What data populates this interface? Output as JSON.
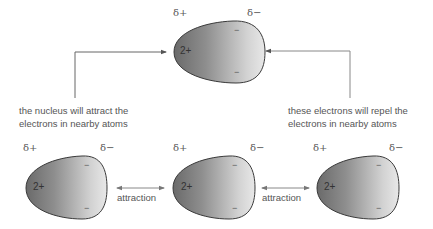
{
  "top_atom": {
    "delta_plus": "δ+",
    "delta_minus": "δ−",
    "nucleus_charge": "2+",
    "electron_sign": "−"
  },
  "captions": {
    "left_line1": "the nucleus will attract the",
    "left_line2": "electrons in nearby atoms",
    "right_line1": "these electrons will repel the",
    "right_line2": "electrons in nearby atoms"
  },
  "bottom_atoms": [
    {
      "delta_plus": "δ+",
      "delta_minus": "δ−",
      "nucleus_charge": "2+",
      "electron_sign": "−"
    },
    {
      "delta_plus": "δ+",
      "delta_minus": "δ−",
      "nucleus_charge": "2+",
      "electron_sign": "−"
    },
    {
      "delta_plus": "δ+",
      "delta_minus": "δ−",
      "nucleus_charge": "2+",
      "electron_sign": "−"
    }
  ],
  "interactions": [
    {
      "label": "attraction"
    },
    {
      "label": "attraction"
    }
  ],
  "colors": {
    "atom_dark": "#6f6f6f",
    "atom_light": "#e4e4e4",
    "outline": "#3a3a3a",
    "line": "#777777",
    "text": "#555555"
  }
}
